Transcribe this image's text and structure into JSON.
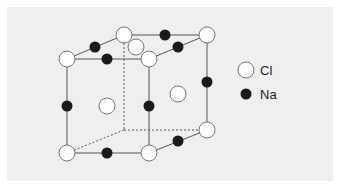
{
  "figure": {
    "background_color": "#efefef",
    "line_color": "#555555",
    "cl_fill": "#ffffff",
    "na_fill": "#1a1a1a"
  },
  "legend": {
    "items": [
      {
        "label": "Cl",
        "type": "open-circle"
      },
      {
        "label": "Na",
        "type": "filled-circle"
      }
    ]
  },
  "cube": {
    "front_face": {
      "tl": [
        67,
        59
      ],
      "tr": [
        149,
        59
      ],
      "bl": [
        67,
        153
      ],
      "br": [
        149,
        153
      ]
    },
    "back_face": {
      "tl": [
        124,
        35
      ],
      "tr": [
        207,
        35
      ],
      "bl": [
        124,
        130
      ],
      "br": [
        207,
        130
      ]
    }
  },
  "atoms": {
    "cl": [
      [
        67,
        59
      ],
      [
        149,
        59
      ],
      [
        67,
        153
      ],
      [
        149,
        153
      ],
      [
        124,
        35
      ],
      [
        207,
        35
      ],
      [
        207,
        130
      ],
      [
        136,
        47
      ],
      [
        107,
        106
      ],
      [
        178,
        94
      ]
    ],
    "na": [
      [
        95,
        47
      ],
      [
        107,
        59
      ],
      [
        165,
        35
      ],
      [
        178,
        47
      ],
      [
        67,
        106
      ],
      [
        149,
        106
      ],
      [
        207,
        82
      ],
      [
        107,
        153
      ],
      [
        178,
        141
      ]
    ]
  }
}
